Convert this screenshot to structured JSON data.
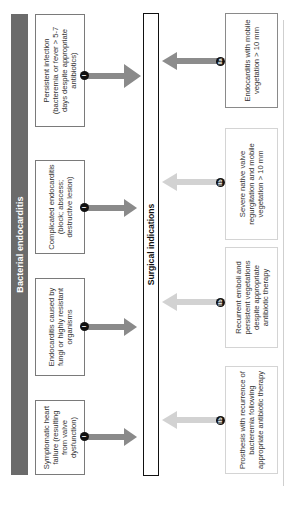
{
  "header": {
    "title": "Bacterial endocarditis",
    "color": "#6b6b6b"
  },
  "center": {
    "label": "Surgical indications"
  },
  "left_boxes": [
    {
      "text": "Persistent infection (bacteremia or fever > 5-7 days despite appropriate antibiotics)",
      "badge": "I"
    },
    {
      "text": "Complicated endocarditis (block; abscess; destructive lesion)",
      "badge": "I"
    },
    {
      "text": "Endocarditis caused by fungi or highly resistant organisms",
      "badge": "I"
    },
    {
      "text": "Symptomatic heart failure (resulting from valve dysfunction)",
      "badge": "I"
    }
  ],
  "right_boxes": [
    {
      "text": "Endocarditis with mobile vegetation > 10 mm",
      "badge": "IIa",
      "arrow_color": "#8c8c8c"
    },
    {
      "text": "Severe native valve regurgitation and mobile vegetation > 10 mm",
      "badge": "IIb",
      "arrow_color": "#d2d2d2"
    },
    {
      "text": "Recurrent emboli and persistent vegetations despite appropriate antibiotic therapy",
      "badge": "IIb",
      "arrow_color": "#d2d2d2"
    },
    {
      "text": "Prosthesis with recurrence of bacteremia following appropriate antibiotic therapy",
      "badge": "IIb",
      "arrow_color": "#d2d2d2"
    }
  ],
  "colors": {
    "left_arrow": "#8a8a8a",
    "strong_right_arrow": "#8c8c8c",
    "weak_right_arrow": "#d2d2d2",
    "badge": "#111111"
  }
}
